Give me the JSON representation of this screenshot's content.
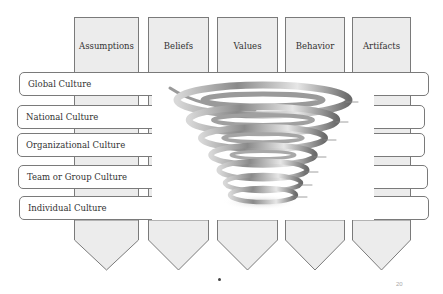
{
  "columns": [
    {
      "label": "Assumptions",
      "x": 74,
      "w": 65
    },
    {
      "label": "Beliefs",
      "x": 148,
      "w": 61
    },
    {
      "label": "Values",
      "x": 217,
      "w": 61
    },
    {
      "label": "Behavior",
      "x": 285,
      "w": 60
    },
    {
      "label": "Artifacts",
      "x": 352,
      "w": 59
    }
  ],
  "rows": [
    {
      "label": "Global Culture",
      "x": 19,
      "y": 72,
      "w": 410
    },
    {
      "label": "National Culture",
      "x": 17,
      "y": 105,
      "w": 408
    },
    {
      "label": "Organizational Culture",
      "x": 17,
      "y": 133,
      "w": 408
    },
    {
      "label": "Team or Group Culture",
      "x": 18,
      "y": 165,
      "w": 410
    },
    {
      "label": "Individual Culture",
      "x": 19,
      "y": 196,
      "w": 410
    }
  ],
  "graphic": {
    "name": "tornado-spiral"
  },
  "footer": {
    "page_number": "20"
  },
  "colors": {
    "box_fill": "#ececec",
    "border": "#7a7a7a",
    "text": "#333333"
  }
}
